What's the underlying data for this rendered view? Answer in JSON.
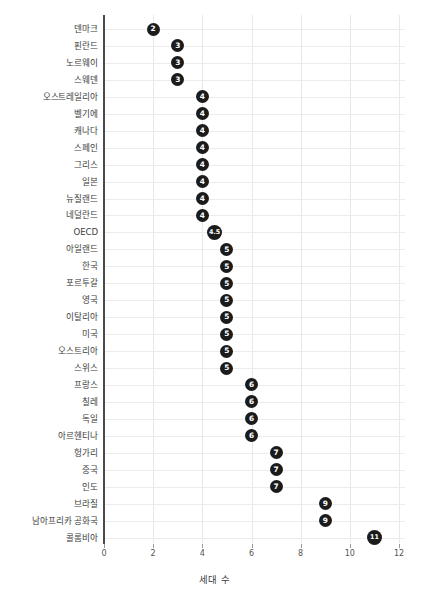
{
  "chart_data": {
    "type": "scatter",
    "orientation": "horizontal",
    "title": "",
    "xlabel": "세대 수",
    "ylabel": "",
    "xlim": [
      0,
      12
    ],
    "xticks": [
      0,
      2,
      4,
      6,
      8,
      10,
      12
    ],
    "xticklabels": [
      "0",
      "2",
      "4",
      "6",
      "8",
      "10",
      "12"
    ],
    "grid": true,
    "legend": null,
    "marker_color": "#1b1b1b",
    "marker_label_color": "#ffffff",
    "gridline_color": "#ececec",
    "axis_color": "#4a4a4a",
    "categories": [
      "덴마크",
      "핀란드",
      "노르웨이",
      "스웨덴",
      "오스트레일리아",
      "벨기에",
      "캐나다",
      "스페인",
      "그리스",
      "일본",
      "뉴질랜드",
      "네덜란드",
      "OECD",
      "아일랜드",
      "한국",
      "포르투갈",
      "영국",
      "이탈리아",
      "미국",
      "오스트리아",
      "스위스",
      "프랑스",
      "칠레",
      "독일",
      "아르헨티나",
      "헝가리",
      "중국",
      "인도",
      "브라질",
      "남아프리카 공화국",
      "콜롬비아"
    ],
    "values": [
      2,
      3,
      3,
      3,
      4,
      4,
      4,
      4,
      4,
      4,
      4,
      4,
      4.5,
      5,
      5,
      5,
      5,
      5,
      5,
      5,
      5,
      6,
      6,
      6,
      6,
      7,
      7,
      7,
      9,
      9,
      11
    ],
    "value_labels": [
      "2",
      "3",
      "3",
      "3",
      "4",
      "4",
      "4",
      "4",
      "4",
      "4",
      "4",
      "4",
      "4.5",
      "5",
      "5",
      "5",
      "5",
      "5",
      "5",
      "5",
      "5",
      "6",
      "6",
      "6",
      "6",
      "7",
      "7",
      "7",
      "9",
      "9",
      "11"
    ]
  }
}
